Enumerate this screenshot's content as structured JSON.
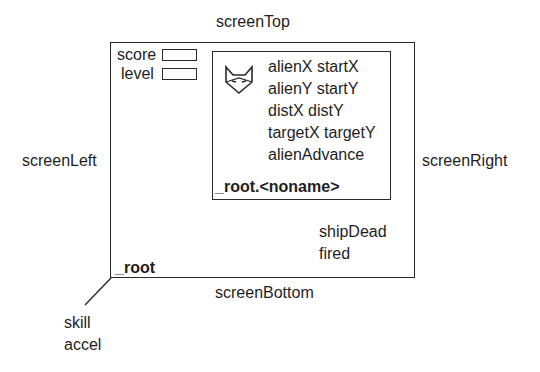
{
  "edges": {
    "top": "screenTop",
    "bottom": "screenBottom",
    "left": "screenLeft",
    "right": "screenRight"
  },
  "root": {
    "label": "_root",
    "fields": [
      {
        "label": "score",
        "value": ""
      },
      {
        "label": "level",
        "value": ""
      }
    ],
    "vars": [
      "shipDead",
      "fired"
    ],
    "outside_vars": [
      "skill",
      "accel"
    ]
  },
  "clip": {
    "label": "_root.<noname>",
    "icon": "fox-icon",
    "vars": [
      "alienX startX",
      "alienY startY",
      "distX distY",
      "targetX targetY",
      "alienAdvance"
    ]
  }
}
